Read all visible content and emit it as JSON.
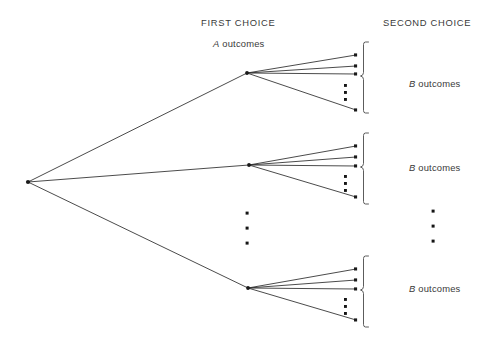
{
  "diagram": {
    "type": "tree-diagram",
    "title_headings": {
      "first_choice": "FIRST CHOICE",
      "second_choice": "SECOND CHOICE"
    },
    "first_choice_label": {
      "variable": "A",
      "text": " outcomes"
    },
    "second_choice_labels": [
      {
        "variable": "B",
        "text": " outcomes"
      },
      {
        "variable": "B",
        "text": " outcomes"
      },
      {
        "variable": "B",
        "text": " outcomes"
      }
    ],
    "colors": {
      "background": "#ffffff",
      "line": "#2a2a2a",
      "brace": "#4a4a4a",
      "text": "#3a3a3a",
      "node": "#1a1a1a"
    },
    "structure": {
      "root_node": {
        "x": 28,
        "y": 182
      },
      "first_level_nodes": [
        {
          "x": 247,
          "y": 73
        },
        {
          "x": 249,
          "y": 165
        },
        {
          "x": 248,
          "y": 288
        }
      ],
      "branches_per_node_shown": 4,
      "branch_end_x": 356,
      "cluster_endpoint_offsets": [
        -18,
        -7,
        1,
        37
      ],
      "cluster_ellipsis_offsets": [
        12,
        19,
        26
      ],
      "vertical_ellipsis_first_choice": {
        "x": 247,
        "y_values": [
          213,
          228,
          243
        ]
      },
      "vertical_ellipsis_second_choice": {
        "x": 433,
        "y_values": [
          211,
          226,
          241
        ]
      }
    }
  }
}
